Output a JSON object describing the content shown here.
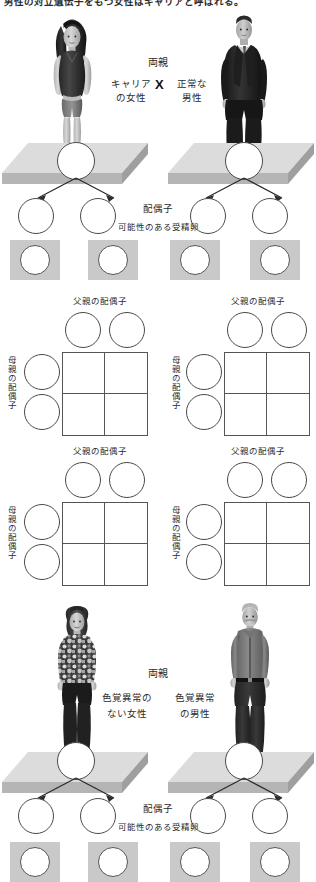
{
  "intro": {
    "text": "男性の対立遺伝子をもつ女性はキャリアと呼ばれる。"
  },
  "sections": [
    {
      "id": "cross-top",
      "parents_label": "両親",
      "mother_label_line1": "キャリア",
      "mother_label_line2": "の女性",
      "cross_symbol": "X",
      "father_label_line1": "正常な",
      "father_label_line2": "男性",
      "gamete_label": "配偶子",
      "zygote_label": "可能性のある受精卵",
      "mother_photo": "woman-carrier-photo",
      "father_photo": "man-normal-photo"
    },
    {
      "id": "cross-bottom",
      "parents_label": "両親",
      "mother_label_line1": "色覚異常の",
      "mother_label_line2": "ない女性",
      "father_label_line1": "色覚異常",
      "father_label_line2": "の男性",
      "gamete_label": "配偶子",
      "zygote_label": "可能性のある受精卵",
      "mother_photo": "woman-normal-vision-photo",
      "father_photo": "man-colorblind-photo"
    }
  ],
  "punnett_squares": [
    {
      "id": "punnett-1",
      "top_label": "父親の配偶子",
      "side_label": "母親の配偶子",
      "columns": 2,
      "rows": 2
    },
    {
      "id": "punnett-2",
      "top_label": "父親の配偶子",
      "side_label": "母親の配偶子",
      "columns": 2,
      "rows": 2
    },
    {
      "id": "punnett-3",
      "top_label": "父親の配偶子",
      "side_label": "母親の配偶子",
      "columns": 2,
      "rows": 2
    },
    {
      "id": "punnett-4",
      "top_label": "父親の配偶子",
      "side_label": "母親の配偶子",
      "columns": 2,
      "rows": 2
    }
  ],
  "colors": {
    "background": "#ffffff",
    "text": "#2b2b2b",
    "circle_stroke": "#4a4a4a",
    "platform_top": "#d8d8d8",
    "platform_front": "#b3b3b3",
    "zygote_box": "#c9c9c9",
    "grid_line": "#555555"
  }
}
